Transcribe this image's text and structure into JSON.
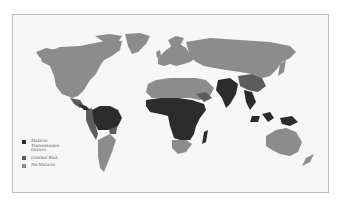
{
  "map": {
    "subject": "World malaria risk map",
    "colors": {
      "transmission": "#2b2b2b",
      "limited": "#5c5c5c",
      "none": "#8c8c8c",
      "background": "#f7f7f7",
      "border": "#bdbdbd"
    }
  },
  "legend": {
    "items": [
      {
        "label": "Malaria Transmission Occurs",
        "color": "#2b2b2b"
      },
      {
        "label": "Limited Risk",
        "color": "#5c5c5c"
      },
      {
        "label": "No Malaria",
        "color": "#8c8c8c"
      }
    ]
  }
}
